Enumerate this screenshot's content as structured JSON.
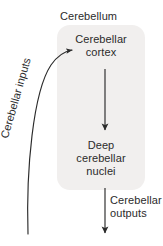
{
  "figure": {
    "type": "flow-diagram",
    "title": "Cerebellum",
    "background_color": "#ffffff",
    "panel_color": "#f1efee",
    "stroke_color": "#2b2b2b",
    "text_color": "#2b2b2b"
  },
  "panel": {
    "name": "Cerebellum",
    "label": "Cerebellum"
  },
  "nodes": [
    {
      "id": "cerebellar-cortex",
      "lines": [
        "Cerebellar",
        "cortex"
      ],
      "line1": "Cerebellar",
      "line2": "cortex"
    },
    {
      "id": "deep-cerebellar-nuclei",
      "lines": [
        "Deep",
        "cerebellar",
        "nuclei"
      ],
      "line1": "Deep",
      "line2": "cerebellar",
      "line3": "nuclei"
    }
  ],
  "arrows": [
    {
      "id": "cerebellar-inputs",
      "line1": "Cerebellar inputs",
      "label": "Cerebellar inputs",
      "shape": "curved",
      "direction": "into-cerebellar-cortex"
    },
    {
      "id": "cortex-to-nuclei",
      "label": "",
      "shape": "straight-vertical",
      "direction": "downward"
    },
    {
      "id": "cerebellar-outputs",
      "line1": "Cerebellar",
      "line2": "outputs",
      "label": "Cerebellar outputs",
      "shape": "straight-vertical",
      "direction": "downward-out-of-cerebellum"
    }
  ]
}
